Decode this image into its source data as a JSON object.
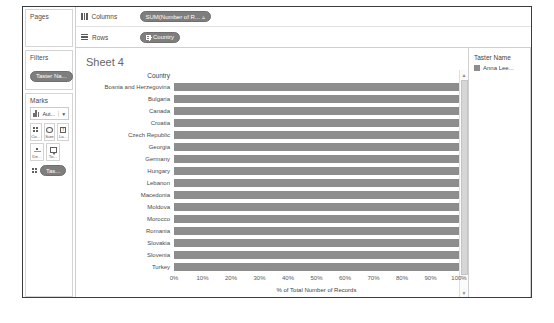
{
  "app": {
    "sheet_title": "Sheet 4"
  },
  "left_rail": {
    "pages": {
      "title": "Pages"
    },
    "filters": {
      "title": "Filters",
      "pills": [
        {
          "label": "Taster Na..."
        }
      ]
    },
    "marks": {
      "title": "Marks",
      "mark_type": {
        "label": "Aut...",
        "icon": "bar-chart-icon",
        "caret": "▼"
      },
      "buttons": [
        {
          "label": "Co...",
          "icon": "color-icon"
        },
        {
          "label": "Size",
          "icon": "size-icon"
        },
        {
          "label": "La...",
          "icon": "label-icon"
        },
        {
          "label": "De...",
          "icon": "detail-icon"
        },
        {
          "label": "To...",
          "icon": "tooltip-icon"
        }
      ],
      "field_pill": {
        "label": "Tas...",
        "icon": "color-icon"
      }
    }
  },
  "shelves": [
    {
      "name": "columns",
      "label": "Columns",
      "icon": "columns-icon",
      "pill": {
        "label": "SUM(Number of R...",
        "suffix": "▵"
      }
    },
    {
      "name": "rows",
      "label": "Rows",
      "icon": "rows-icon",
      "pill": {
        "label": "Country",
        "prefix_icon": "grid-icon"
      }
    }
  ],
  "legend": {
    "title": "Taster Name",
    "items": [
      {
        "label": "Anna Lee...",
        "color": "#8d8d8d"
      }
    ]
  },
  "scrollbar": {
    "up": "▲",
    "down": "▼"
  },
  "chart_data": {
    "type": "bar",
    "orientation": "horizontal",
    "title": "Sheet 4",
    "row_header": "Country",
    "xlabel": "% of Total Number of Records",
    "ylabel": "Country",
    "xlim": [
      0,
      100
    ],
    "xticks": [
      "0%",
      "10%",
      "20%",
      "30%",
      "40%",
      "50%",
      "60%",
      "70%",
      "80%",
      "90%",
      "100%"
    ],
    "xtick_values": [
      0,
      10,
      20,
      30,
      40,
      50,
      60,
      70,
      80,
      90,
      100
    ],
    "grid": false,
    "legend_position": "right",
    "bar_color": "#8d8d8d",
    "categories": [
      "Bosnia and Herzegovina",
      "Bulgaria",
      "Canada",
      "Croatia",
      "Czech Republic",
      "Georgia",
      "Germany",
      "Hungary",
      "Lebanon",
      "Macedonia",
      "Moldova",
      "Morocco",
      "Romania",
      "Slovakia",
      "Slovenia",
      "Turkey"
    ],
    "values": [
      100,
      100,
      100,
      100,
      100,
      100,
      100,
      100,
      100,
      100,
      100,
      100,
      100,
      100,
      100,
      100
    ],
    "series": [
      {
        "name": "Anna Lee...",
        "values": [
          100,
          100,
          100,
          100,
          100,
          100,
          100,
          100,
          100,
          100,
          100,
          100,
          100,
          100,
          100,
          100
        ]
      }
    ]
  }
}
